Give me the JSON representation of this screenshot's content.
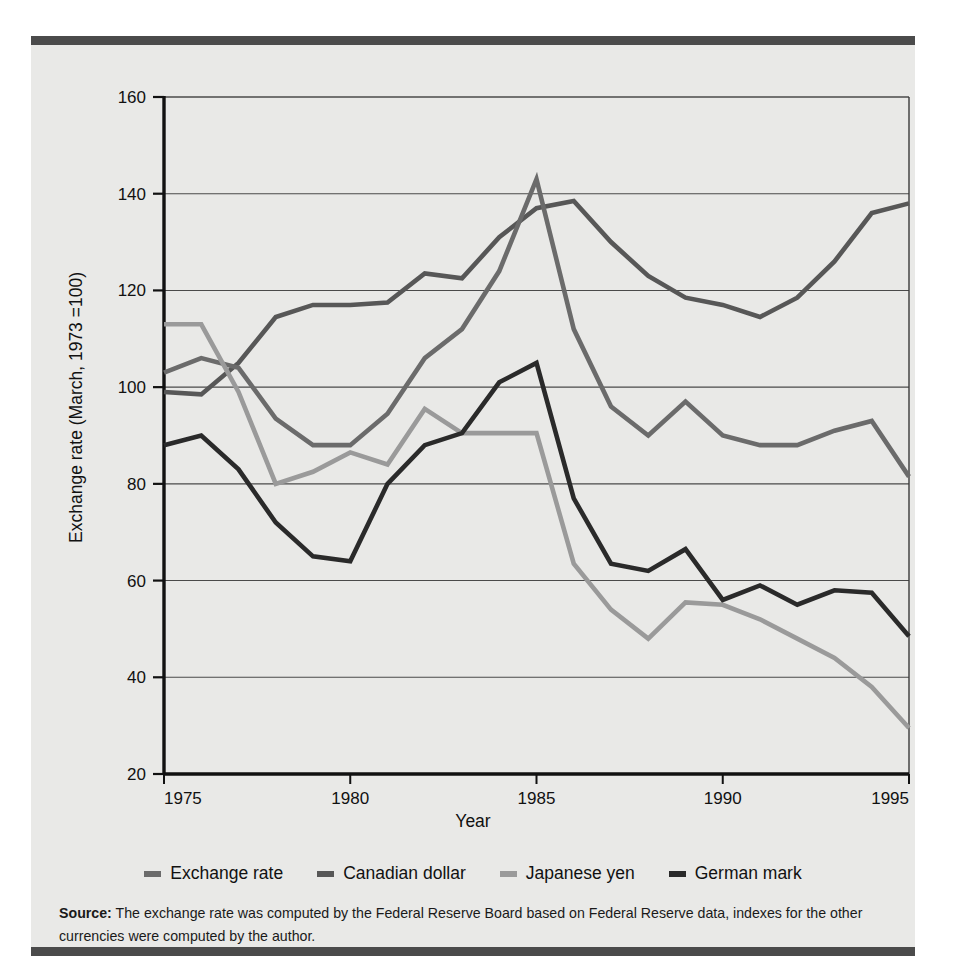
{
  "axes": {
    "y_title": "Exchange rate (March, 1973 =100)",
    "x_title": "Year",
    "y_ticks": [
      "160",
      "140",
      "120",
      "100",
      "80",
      "60",
      "40",
      "20"
    ],
    "x_ticks": [
      "1975",
      "1980",
      "1985",
      "1990",
      "1995"
    ]
  },
  "legend": {
    "items": [
      {
        "label": "Exchange rate",
        "color": "#6b6b6b"
      },
      {
        "label": "Canadian dollar",
        "color": "#575757"
      },
      {
        "label": "Japanese yen",
        "color": "#9a9a9a"
      },
      {
        "label": "German mark",
        "color": "#2a2a2a"
      }
    ]
  },
  "source": {
    "label": "Source:",
    "text": " The exchange rate was computed by the Federal Reserve Board based on Federal Reserve data, indexes for the other currencies were computed by the author."
  },
  "chart_data": {
    "type": "line",
    "title": "",
    "xlabel": "Year",
    "ylabel": "Exchange rate (March, 1973 =100)",
    "xlim": [
      1975,
      1995
    ],
    "ylim": [
      20,
      160
    ],
    "ytick_step": 20,
    "grid": "horizontal",
    "legend_position": "bottom",
    "x": [
      1975,
      1976,
      1977,
      1978,
      1979,
      1980,
      1981,
      1982,
      1983,
      1984,
      1985,
      1986,
      1987,
      1988,
      1989,
      1990,
      1991,
      1992,
      1993,
      1994,
      1995
    ],
    "series": [
      {
        "name": "Exchange rate",
        "color": "#6b6b6b",
        "values": [
          103,
          106,
          104,
          93.5,
          88,
          88,
          94.5,
          106,
          112,
          124,
          143,
          112,
          96,
          90,
          97,
          90,
          88,
          88,
          91,
          93,
          81.5
        ]
      },
      {
        "name": "Canadian dollar",
        "color": "#575757",
        "values": [
          99,
          98.5,
          105,
          114.5,
          117,
          117,
          117.5,
          123.5,
          122.5,
          131,
          137,
          138.5,
          130,
          123,
          118.5,
          117,
          114.5,
          118.5,
          126,
          136,
          138
        ]
      },
      {
        "name": "Japanese yen",
        "color": "#9a9a9a",
        "values": [
          113,
          113,
          99,
          80,
          82.5,
          86.5,
          84,
          95.5,
          90.5,
          90.5,
          90.5,
          63.5,
          54,
          48,
          55.5,
          55,
          52,
          48,
          44,
          38,
          29.5
        ]
      },
      {
        "name": "German mark",
        "color": "#2a2a2a",
        "values": [
          88,
          90,
          83,
          72,
          65,
          64,
          80,
          88,
          90.5,
          101,
          105,
          77,
          63.5,
          62,
          66.5,
          56,
          59,
          55,
          58,
          57.5,
          48.5
        ]
      }
    ]
  }
}
